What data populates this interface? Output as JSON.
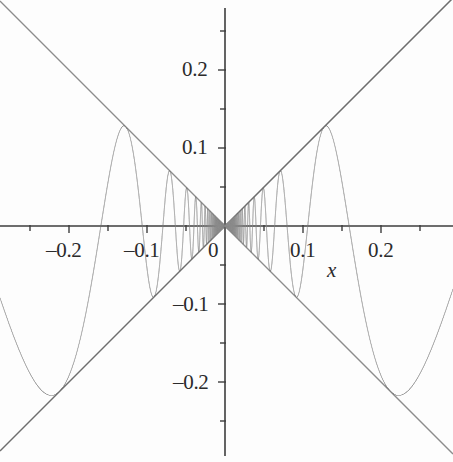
{
  "figure": {
    "width": 453,
    "height": 462,
    "background": "#fdfdfd",
    "curve_color": "#8c8c8c",
    "axis_color": "#4a4a4a",
    "text_color": "#2b2b2b"
  },
  "axes": {
    "x_axis_label": "x",
    "y_axis_label": "",
    "origin_px": {
      "x": 225,
      "y": 226
    },
    "px_per_unit": 780,
    "xlim": [
      -0.2885,
      0.2923
    ],
    "ylim": [
      -0.2897,
      0.2897
    ],
    "x_major_ticks": [
      -0.2,
      -0.1,
      0,
      0.1,
      0.2
    ],
    "x_minor_ticks": [
      -0.25,
      -0.15,
      -0.05,
      0.05,
      0.15,
      0.25
    ],
    "y_major_ticks": [
      -0.2,
      -0.1,
      0.1,
      0.2
    ],
    "y_minor_ticks": [
      -0.25,
      -0.15,
      -0.05,
      0.05,
      0.15,
      0.25
    ],
    "x_tick_labels": [
      "–0.2",
      "–0.1",
      "0",
      "0.1",
      "0.2"
    ],
    "y_tick_labels": [
      "0.2",
      "0.1",
      "–0.1",
      "–0.2"
    ],
    "origin_label": "0",
    "grid": false,
    "legend": "none"
  },
  "chart_data": {
    "type": "line",
    "title": "",
    "subtitle": "",
    "xlabel": "x",
    "ylabel": "",
    "xlim": [
      -0.2885,
      0.2923
    ],
    "ylim": [
      -0.2897,
      0.2897
    ],
    "grid": false,
    "legend_position": "none",
    "xticks": [
      -0.2,
      -0.1,
      0,
      0.1,
      0.2
    ],
    "yticks": [
      -0.2,
      -0.1,
      0.1,
      0.2
    ],
    "xticklabels": [
      "–0.2",
      "–0.1",
      "0",
      "0.1",
      "0.2"
    ],
    "yticklabels": [
      "–0.2",
      "–0.1",
      "0.1",
      "0.2"
    ],
    "series": [
      {
        "name": "x sin(1/x)",
        "formula": "y = x*sin(1/x)",
        "color": "#8c8c8c",
        "linewidth": 1,
        "sample_points": [
          {
            "x": -0.2885,
            "y": -0.2176
          },
          {
            "x": -0.25,
            "y": -0.1301
          },
          {
            "x": -0.2122,
            "y": -0.2122
          },
          {
            "x": -0.18,
            "y": -0.1136
          },
          {
            "x": -0.15,
            "y": 0.095
          },
          {
            "x": -0.1273,
            "y": 0.1273
          },
          {
            "x": -0.1,
            "y": 0.0544
          },
          {
            "x": -0.0909,
            "y": -0.0909
          },
          {
            "x": -0.075,
            "y": 0.0179
          },
          {
            "x": -0.0707,
            "y": 0.0707
          },
          {
            "x": -0.06,
            "y": -0.0553
          },
          {
            "x": -0.0579,
            "y": -0.0579
          },
          {
            "x": -0.045,
            "y": 0.0444
          },
          {
            "x": -0.049,
            "y": 0.049
          },
          {
            "x": -0.035,
            "y": -0.0302
          },
          {
            "x": -0.0425,
            "y": -0.0425
          },
          {
            "x": -0.02,
            "y": 0.0132
          },
          {
            "x": -0.01,
            "y": -0.0051
          },
          {
            "x": 0.0,
            "y": 0.0
          },
          {
            "x": 0.01,
            "y": 0.0051
          },
          {
            "x": 0.02,
            "y": -0.0132
          },
          {
            "x": 0.0425,
            "y": 0.0425
          },
          {
            "x": 0.049,
            "y": -0.049
          },
          {
            "x": 0.0579,
            "y": 0.0579
          },
          {
            "x": 0.0707,
            "y": -0.0707
          },
          {
            "x": 0.0909,
            "y": 0.0909
          },
          {
            "x": 0.1273,
            "y": 0.1273
          },
          {
            "x": 0.15,
            "y": 0.095
          },
          {
            "x": 0.2122,
            "y": -0.2122
          },
          {
            "x": 0.25,
            "y": -0.1301
          },
          {
            "x": 0.2923,
            "y": -0.2238
          }
        ],
        "envelope_touch_maxima_x": [
          0.1273,
          0.049,
          0.0304,
          0.0221
        ],
        "envelope_touch_minima_x": [
          0.2122,
          0.0707,
          0.0379,
          0.0259
        ]
      },
      {
        "name": "y = x",
        "formula": "y = x",
        "color": "#6e6e6e",
        "linewidth": 1,
        "sample_points": [
          {
            "x": -0.2885,
            "y": -0.2885
          },
          {
            "x": 0.2923,
            "y": 0.2923
          }
        ]
      },
      {
        "name": "y = -x",
        "formula": "y = -x",
        "color": "#8c8c8c",
        "linewidth": 1,
        "sample_points": [
          {
            "x": -0.2885,
            "y": 0.2885
          },
          {
            "x": 0.2923,
            "y": -0.2923
          }
        ]
      }
    ]
  },
  "labels": {
    "x_ticks": [
      {
        "text": "–0.2",
        "left": 46,
        "top": 238
      },
      {
        "text": "–0.1",
        "left": 124,
        "top": 238
      },
      {
        "text": "0",
        "left": 208,
        "top": 238
      },
      {
        "text": "0.1",
        "left": 290,
        "top": 238
      },
      {
        "text": "0.2",
        "left": 368,
        "top": 238
      }
    ],
    "y_ticks": [
      {
        "text": "0.2",
        "left": 182,
        "top": 57
      },
      {
        "text": "0.1",
        "left": 182,
        "top": 135
      },
      {
        "text": "–0.1",
        "left": 173,
        "top": 292
      },
      {
        "text": "–0.2",
        "left": 173,
        "top": 370
      }
    ],
    "axis_name": {
      "text": "x",
      "left": 327,
      "top": 258
    }
  }
}
